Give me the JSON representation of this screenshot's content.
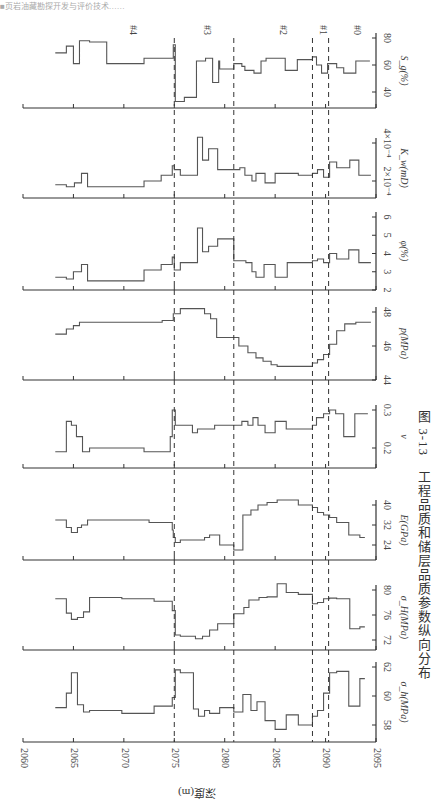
{
  "page": {
    "header_fragment": "■页岩油藏勘探开发与评价技术……",
    "caption": "图 3-13　工程品质和储层品质参数纵向分布",
    "depth_axis_label": "深度(m)"
  },
  "chart_data": {
    "type": "line",
    "orientation": "rotated 90° clockwise (depth along horizontal screen axis)",
    "xlabel": "深度(m)",
    "x_ticks": [
      2060,
      2065,
      2070,
      2075,
      2080,
      2085,
      2090,
      2095
    ],
    "xlim": [
      2060,
      2095
    ],
    "grid": false,
    "step": true,
    "zone_boundaries": [
      2075.0,
      2080.9,
      2088.7,
      2090.3
    ],
    "zones": [
      "#4",
      "#3",
      "#2",
      "#1",
      "#0"
    ],
    "panels": [
      {
        "name": "S_g",
        "label": "S_g(%)",
        "ticks": [
          "40",
          "60",
          "80"
        ],
        "ylim": [
          30,
          82
        ],
        "depth": [
          2063.2,
          2064.3,
          2065.0,
          2065.6,
          2066.6,
          2068.3,
          2070.3,
          2072.0,
          2073.9,
          2074.9,
          2075.1,
          2076.0,
          2077.2,
          2078.1,
          2078.8,
          2079.4,
          2079.5,
          2080.9,
          2081.7,
          2082.0,
          2082.9,
          2083.6,
          2084.1,
          2085.2,
          2086.0,
          2087.2,
          2088.7,
          2089.1,
          2089.6,
          2090.2,
          2091.1,
          2091.8,
          2093.0,
          2093.9
        ],
        "values": [
          69,
          74,
          61,
          78,
          77,
          61,
          61,
          65,
          65,
          75,
          33,
          36,
          63,
          65,
          47,
          63,
          57,
          61,
          59,
          56,
          54,
          63,
          65,
          65,
          56,
          64,
          66,
          60,
          54,
          61,
          58,
          54,
          63,
          63
        ]
      },
      {
        "name": "K_w",
        "label": "K_w(mD)",
        "ticks": [
          "2×10⁻⁴",
          "4×10⁻⁴"
        ],
        "ylim": [
          0.00012,
          0.00046
        ],
        "depth": [
          2063.2,
          2064.3,
          2065.1,
          2065.8,
          2066.4,
          2069.8,
          2072.0,
          2073.7,
          2074.8,
          2075.0,
          2075.6,
          2077.3,
          2077.8,
          2078.4,
          2079.3,
          2080.9,
          2081.5,
          2082.0,
          2082.7,
          2083.1,
          2084.0,
          2085.0,
          2086.1,
          2087.3,
          2088.7,
          2089.2,
          2089.8,
          2090.4,
          2091.1,
          2092.4,
          2093.3,
          2094.0
        ],
        "values": [
          0.00018,
          0.00017,
          0.00019,
          0.00024,
          0.00017,
          0.00017,
          0.0002,
          0.00023,
          0.00028,
          0.00026,
          0.00023,
          0.00043,
          0.00031,
          0.00037,
          0.00026,
          0.00026,
          0.00027,
          0.00023,
          0.0002,
          0.00024,
          0.00019,
          0.00024,
          0.00024,
          0.00023,
          0.00024,
          0.00026,
          0.00022,
          0.0003,
          0.00027,
          0.00031,
          0.00023,
          0.00023
        ]
      },
      {
        "name": "phi",
        "label": "φ(%)",
        "ticks": [
          "2",
          "3",
          "4",
          "5",
          "6"
        ],
        "ylim": [
          2,
          6
        ],
        "depth": [
          2063.2,
          2064.3,
          2065.0,
          2065.8,
          2066.4,
          2069.8,
          2072.0,
          2073.7,
          2074.8,
          2075.0,
          2075.6,
          2077.3,
          2077.8,
          2078.4,
          2079.3,
          2080.9,
          2081.5,
          2082.1,
          2082.7,
          2083.1,
          2083.9,
          2085.0,
          2086.2,
          2087.3,
          2088.7,
          2089.2,
          2089.8,
          2090.4,
          2091.1,
          2092.3,
          2093.3,
          2094.0
        ],
        "values": [
          2.7,
          2.6,
          3.0,
          3.4,
          2.5,
          2.5,
          3.1,
          3.4,
          3.8,
          3.1,
          3.5,
          5.4,
          4.1,
          4.4,
          4.8,
          3.6,
          3.6,
          3.5,
          3.0,
          2.7,
          3.4,
          2.7,
          3.5,
          3.5,
          3.6,
          3.7,
          3.5,
          4.0,
          3.7,
          4.2,
          3.5,
          3.5
        ]
      },
      {
        "name": "p",
        "label": "p(MPa)",
        "ticks": [
          "44",
          "46",
          "48"
        ],
        "ylim": [
          44,
          49
        ],
        "depth": [
          2063.2,
          2064.3,
          2065.0,
          2065.6,
          2066.6,
          2068.6,
          2070.3,
          2072.0,
          2073.8,
          2074.9,
          2075.6,
          2076.8,
          2078.0,
          2078.6,
          2079.2,
          2080.9,
          2081.4,
          2082.3,
          2083.1,
          2083.8,
          2084.6,
          2085.2,
          2086.4,
          2088.7,
          2089.2,
          2089.8,
          2090.4,
          2091.1,
          2091.9,
          2093.0,
          2094.0
        ],
        "values": [
          46.7,
          47.0,
          47.2,
          47.4,
          47.4,
          47.4,
          47.4,
          47.4,
          47.5,
          47.9,
          48.2,
          48.2,
          47.9,
          47.6,
          46.5,
          46.5,
          46.0,
          45.6,
          45.3,
          45.1,
          44.9,
          44.8,
          44.8,
          45.0,
          45.2,
          45.5,
          46.1,
          46.9,
          47.3,
          47.4,
          47.4
        ]
      },
      {
        "name": "nu",
        "label": "ν",
        "ticks": [
          "0.2",
          "0.3"
        ],
        "ylim": [
          0.15,
          0.32
        ],
        "depth": [
          2063.2,
          2064.3,
          2064.8,
          2065.3,
          2065.9,
          2066.6,
          2069.8,
          2072.0,
          2074.6,
          2074.8,
          2075.1,
          2076.8,
          2077.3,
          2078.0,
          2079.0,
          2080.9,
          2081.7,
          2082.3,
          2082.8,
          2083.3,
          2084.0,
          2085.0,
          2086.1,
          2088.7,
          2089.1,
          2089.8,
          2090.4,
          2091.0,
          2091.8,
          2092.9,
          2093.7
        ],
        "values": [
          0.19,
          0.27,
          0.26,
          0.23,
          0.19,
          0.2,
          0.2,
          0.19,
          0.23,
          0.3,
          0.26,
          0.24,
          0.25,
          0.25,
          0.26,
          0.26,
          0.27,
          0.26,
          0.28,
          0.26,
          0.24,
          0.27,
          0.25,
          0.26,
          0.28,
          0.29,
          0.3,
          0.29,
          0.23,
          0.29,
          0.29
        ]
      },
      {
        "name": "E",
        "label": "E(GPa)",
        "ticks": [
          "24",
          "32",
          "40"
        ],
        "ylim": [
          20,
          44
        ],
        "depth": [
          2063.2,
          2064.3,
          2064.8,
          2065.4,
          2065.8,
          2066.4,
          2069.8,
          2072.5,
          2074.8,
          2074.9,
          2075.1,
          2075.6,
          2077.3,
          2078.0,
          2078.5,
          2079.5,
          2080.9,
          2081.8,
          2082.6,
          2083.3,
          2084.2,
          2085.2,
          2086.1,
          2087.3,
          2088.7,
          2089.2,
          2089.8,
          2090.4,
          2091.1,
          2092.3,
          2093.4
        ],
        "values": [
          34,
          31,
          29,
          31,
          32,
          34,
          34,
          33,
          30,
          27,
          25,
          26,
          26,
          27,
          28,
          24,
          22,
          36,
          38,
          40,
          41,
          42,
          42,
          40,
          39,
          37,
          36,
          35,
          33,
          28,
          27
        ]
      },
      {
        "name": "sigma_H",
        "label": "σ_H(MPa)",
        "ticks": [
          "72",
          "76",
          "80"
        ],
        "ylim": [
          70,
          82
        ],
        "depth": [
          2063.2,
          2064.3,
          2064.8,
          2065.4,
          2066.0,
          2066.6,
          2069.8,
          2073.0,
          2074.8,
          2075.1,
          2075.6,
          2077.1,
          2077.8,
          2078.5,
          2079.3,
          2080.9,
          2081.9,
          2082.4,
          2083.4,
          2084.2,
          2085.2,
          2086.1,
          2087.3,
          2088.7,
          2089.2,
          2089.8,
          2090.4,
          2091.1,
          2092.4,
          2093.4
        ],
        "values": [
          78.6,
          76.3,
          75.3,
          75.6,
          76.5,
          78.8,
          78.6,
          78.2,
          76.7,
          72.8,
          72.6,
          72.2,
          72.6,
          73.6,
          74.6,
          76.2,
          77.2,
          78.4,
          78.8,
          78.9,
          81.0,
          79.6,
          79.3,
          77.8,
          78.0,
          78.6,
          78.7,
          78.6,
          73.8,
          74.1
        ]
      },
      {
        "name": "sigma_h",
        "label": "σ_h(MPa)",
        "ticks": [
          "58",
          "60",
          "62"
        ],
        "ylim": [
          57,
          63
        ],
        "depth": [
          2063.2,
          2064.3,
          2064.8,
          2065.4,
          2066.0,
          2066.6,
          2069.8,
          2073.0,
          2074.8,
          2075.1,
          2075.6,
          2076.9,
          2077.4,
          2078.0,
          2078.5,
          2079.5,
          2080.9,
          2081.8,
          2082.6,
          2083.2,
          2084.0,
          2085.0,
          2086.1,
          2087.3,
          2088.7,
          2089.2,
          2089.8,
          2090.4,
          2091.1,
          2092.3,
          2093.4
        ],
        "values": [
          59.2,
          60.2,
          61.6,
          59.4,
          58.9,
          59.0,
          58.8,
          59.3,
          59.9,
          61.8,
          61.6,
          59.1,
          58.6,
          59.0,
          58.8,
          59.2,
          58.9,
          60.1,
          59.0,
          59.6,
          58.3,
          57.7,
          58.7,
          58.0,
          58.6,
          59.0,
          60.2,
          61.6,
          61.7,
          59.3,
          61.2
        ]
      }
    ]
  }
}
